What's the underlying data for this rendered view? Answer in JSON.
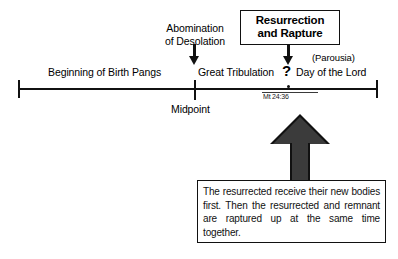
{
  "diagram": {
    "timeline": {
      "start_cap": "timeline-start",
      "end_cap": "timeline-end",
      "segments": [
        {
          "id": "birth-pangs",
          "label": "Beginning of Birth Pangs"
        },
        {
          "id": "great-tribulation",
          "label": "Great Tribulation"
        },
        {
          "id": "day-of-the-lord",
          "label": "Day of the Lord"
        }
      ],
      "markers": [
        {
          "id": "midpoint",
          "label": "Midpoint"
        },
        {
          "id": "parousia-question",
          "label": "?"
        },
        {
          "id": "scripture-citation",
          "label": "Mt 24:36"
        }
      ]
    },
    "callouts": [
      {
        "id": "abomination",
        "label": "Abomination\nof Desolation",
        "line1": "Abomination",
        "line2": "of Desolation"
      },
      {
        "id": "resurrection-rapture",
        "line1": "Resurrection",
        "line2": "and Rapture"
      }
    ],
    "annotations": {
      "parousia": "(Parousia)"
    },
    "note": {
      "text": "The resurrected receive their new bodies first. Then the resurrected and remnant are raptured up at the same time together."
    },
    "colors": {
      "ink": "#111111",
      "arrow_fill": "#3b3b3b",
      "background": "#ffffff"
    }
  }
}
